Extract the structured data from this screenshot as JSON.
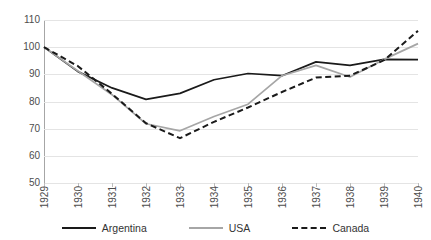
{
  "header": {
    "clipped_title_fragment": ""
  },
  "chart_data": {
    "type": "line",
    "title": "",
    "xlabel": "",
    "ylabel": "",
    "x": [
      "1929",
      "1930",
      "1931",
      "1932",
      "1933",
      "1934",
      "1935",
      "1936",
      "1937",
      "1938",
      "1939",
      "1940"
    ],
    "categories": [
      "1929",
      "1930",
      "1931",
      "1932",
      "1933",
      "1934",
      "1935",
      "1936",
      "1937",
      "1938",
      "1939",
      "1940"
    ],
    "series": [
      {
        "name": "Argentina",
        "style": "solid",
        "color": "#1a1a1a",
        "values": [
          100.0,
          91.0,
          85.0,
          80.8,
          83.0,
          88.0,
          90.3,
          89.5,
          94.6,
          93.3,
          95.5,
          95.4
        ]
      },
      {
        "name": "USA",
        "style": "solid",
        "color": "#a6a6a6",
        "values": [
          100.0,
          91.2,
          82.5,
          71.8,
          69.2,
          74.5,
          79.0,
          89.5,
          93.3,
          89.0,
          95.5,
          101.3
        ]
      },
      {
        "name": "Canada",
        "style": "dashed",
        "color": "#1a1a1a",
        "values": [
          100.0,
          93.0,
          82.8,
          72.0,
          66.5,
          72.5,
          77.8,
          83.5,
          88.8,
          89.5,
          95.2,
          106.0
        ]
      }
    ],
    "ylim": [
      50,
      110
    ],
    "yticks": [
      50,
      60,
      70,
      80,
      90,
      100,
      110
    ],
    "ytick_labels": [
      "50",
      "60",
      "70",
      "80",
      "90",
      "100",
      "110"
    ],
    "grid": true,
    "grid_axis": "y",
    "legend_position": "bottom",
    "legend": [
      "Argentina",
      "USA",
      "Canada"
    ]
  },
  "colors": {
    "argentina": "#1a1a1a",
    "usa": "#a6a6a6",
    "canada": "#1a1a1a",
    "gridline": "#e4e4e4",
    "axis": "#a6a6a6",
    "tick_text": "#4d4d4d"
  }
}
